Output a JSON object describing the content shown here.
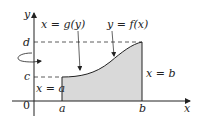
{
  "figure": {
    "axes": {
      "x_label": "x",
      "y_label": "y",
      "origin_label": "0"
    },
    "ticks": {
      "x": [
        "a",
        "b"
      ],
      "y": [
        "c",
        "d"
      ]
    },
    "curve_labels": {
      "inverse": "x = g(y)",
      "function": "y = f(x)"
    },
    "line_labels": {
      "left": "x = a",
      "right": "x = b"
    },
    "colors": {
      "region_fill": "#d9d9d9",
      "lines": "#222222"
    },
    "rotation_indicator": "rotation-about-y-axis"
  }
}
